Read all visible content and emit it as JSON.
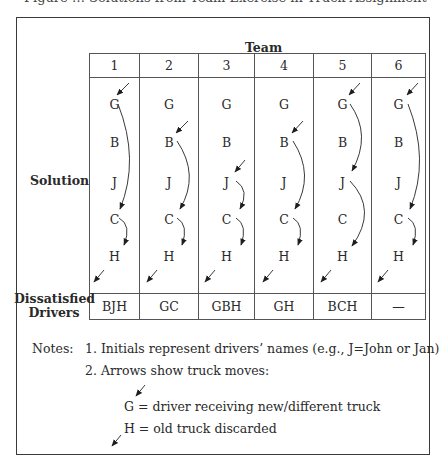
{
  "caption_cut": "Figure … Solutions from Team Exercise in Truck Assignment",
  "header": {
    "team_label": "Team"
  },
  "row_labels": {
    "solution": "Solution",
    "dissatisfied_line1": "Dissatisfied",
    "dissatisfied_line2": "Drivers"
  },
  "teams": [
    {
      "number": "1",
      "letters": [
        "G",
        "B",
        "J",
        "C",
        "H"
      ],
      "dissatisfied": "BJH"
    },
    {
      "number": "2",
      "letters": [
        "G",
        "B",
        "J",
        "C",
        "H"
      ],
      "dissatisfied": "GC"
    },
    {
      "number": "3",
      "letters": [
        "G",
        "B",
        "J",
        "C",
        "H"
      ],
      "dissatisfied": "GBH"
    },
    {
      "number": "4",
      "letters": [
        "G",
        "B",
        "J",
        "C",
        "H"
      ],
      "dissatisfied": "GH"
    },
    {
      "number": "5",
      "letters": [
        "G",
        "B",
        "J",
        "C",
        "H"
      ],
      "dissatisfied": "BCH"
    },
    {
      "number": "6",
      "letters": [
        "G",
        "B",
        "J",
        "C",
        "H"
      ],
      "dissatisfied": "—"
    }
  ],
  "moves": [
    {
      "team": "1",
      "new_truck_to": "G",
      "chain": [
        "G→C",
        "C→H"
      ],
      "discarded_from": "H"
    },
    {
      "team": "2",
      "new_truck_to": "B",
      "chain": [
        "B→C",
        "C→H"
      ],
      "discarded_from": "H"
    },
    {
      "team": "3",
      "new_truck_to": "J",
      "chain": [
        "J→C",
        "C→H"
      ],
      "discarded_from": "H"
    },
    {
      "team": "4",
      "new_truck_to": "B",
      "chain": [
        "B→C",
        "C→H"
      ],
      "discarded_from": "H"
    },
    {
      "team": "5",
      "new_truck_to": "G",
      "chain": [
        "G→J",
        "J→H"
      ],
      "discarded_from": "H"
    },
    {
      "team": "6",
      "new_truck_to": "G",
      "chain": [
        "G→C",
        "C→H"
      ],
      "discarded_from": "H"
    }
  ],
  "notes": {
    "label": "Notes:",
    "item1": "1. Initials represent drivers’ names (e.g., J=John or Jan)",
    "item2": "2. Arrows show truck moves:",
    "legend_g": "G = driver receiving new/different truck",
    "legend_h": "H = old truck discarded"
  }
}
